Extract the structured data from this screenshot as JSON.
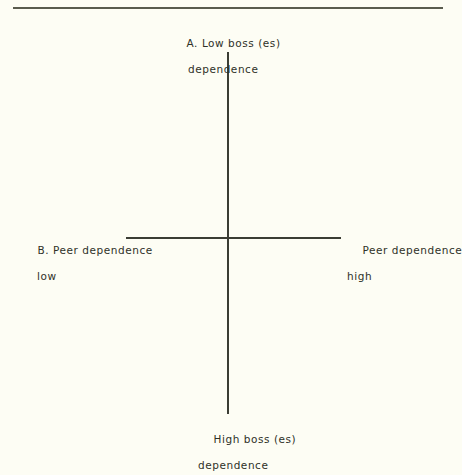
{
  "figure": {
    "background_color": "#fdfdf4",
    "line_color": "#3b3d34",
    "rule_color": "#5a5c4e",
    "text_color": "#2f3128"
  },
  "chart_data": {
    "type": "scatter",
    "title": "",
    "subtitle": "",
    "xlabel": "Peer dependence",
    "ylabel": "Boss(es) dependence",
    "grid": false,
    "legend": "none",
    "xlim": [
      -1,
      1
    ],
    "ylim": [
      -1,
      1
    ],
    "x": [],
    "y": [],
    "values": [],
    "categories": [],
    "annotations": [
      {
        "position": "top",
        "line1": "A. Low boss (es)",
        "line2": "dependence"
      },
      {
        "position": "bottom",
        "line1": "High boss (es)",
        "line2": "dependence"
      },
      {
        "position": "left",
        "line1": "B. Peer dependence",
        "line2": "low"
      },
      {
        "position": "right",
        "line1": "Peer dependence",
        "line2": "high"
      }
    ]
  },
  "axes": {
    "vertical_name": "boss-dependence-axis",
    "horizontal_name": "peer-dependence-axis"
  }
}
